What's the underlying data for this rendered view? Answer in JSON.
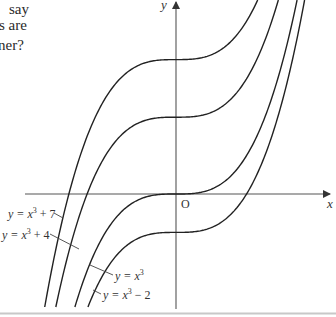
{
  "question_fragment": {
    "lines": [
      "say",
      "s are",
      "ner?"
    ]
  },
  "axes": {
    "x_label": "x",
    "y_label": "y",
    "origin_label": "O",
    "color": "#555555"
  },
  "curve_color": "#222222",
  "chart_data": {
    "type": "line",
    "title": "",
    "xlabel": "x",
    "ylabel": "y",
    "grid": false,
    "legend_position": "inline leader-line labels",
    "xlim": [
      -2.7,
      2.8
    ],
    "ylim": [
      -6.2,
      10.1
    ],
    "series": [
      {
        "name": "y = x³ + 7",
        "expr": "x^3 + 7",
        "shift": 7
      },
      {
        "name": "y = x³ + 4",
        "expr": "x^3 + 4",
        "shift": 4
      },
      {
        "name": "y = x³",
        "expr": "x^3",
        "shift": 0
      },
      {
        "name": "y = x³ − 2",
        "expr": "x^3 - 2",
        "shift": -2
      }
    ],
    "annotations": [
      {
        "text": "y = x³ + 7",
        "points_to": "y = x³ + 7"
      },
      {
        "text": "y = x³ + 4",
        "points_to": "y = x³ + 4"
      },
      {
        "text": "y = x³",
        "points_to": "y = x³"
      },
      {
        "text": "y = x³ − 2",
        "points_to": "y = x³ − 2"
      }
    ]
  },
  "labels": [
    {
      "base": "y = x",
      "sup": "3",
      "rest": " + 7"
    },
    {
      "base": "y = x",
      "sup": "3",
      "rest": " + 4"
    },
    {
      "base": "y = x",
      "sup": "3",
      "rest": ""
    },
    {
      "base": "y = x",
      "sup": "3",
      "rest": " − 2"
    }
  ]
}
